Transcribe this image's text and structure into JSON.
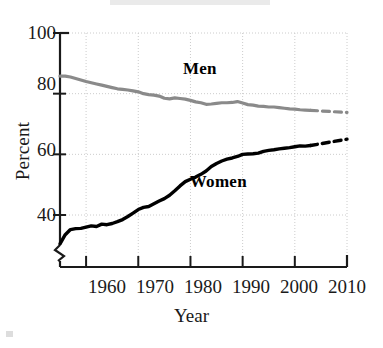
{
  "chart_data": {
    "type": "line",
    "title": "",
    "xlabel": "Year",
    "ylabel": "Percent",
    "xlim": [
      1955,
      2010
    ],
    "ylim": [
      28,
      100
    ],
    "xticks": [
      1960,
      1970,
      1980,
      1990,
      2000,
      2010
    ],
    "yticks": [
      40,
      60,
      80,
      100
    ],
    "grid": true,
    "y_axis_break": true,
    "legend_position": "inline-labels",
    "series": [
      {
        "name": "Men",
        "color": "#8a8a8a",
        "label_x": 1982,
        "label_y": 88,
        "x": [
          1955,
          1956,
          1957,
          1958,
          1959,
          1960,
          1961,
          1962,
          1963,
          1964,
          1965,
          1966,
          1967,
          1968,
          1969,
          1970,
          1971,
          1972,
          1973,
          1974,
          1975,
          1976,
          1977,
          1978,
          1979,
          1980,
          1981,
          1982,
          1983,
          1984,
          1985,
          1986,
          1987,
          1988,
          1989,
          1990,
          1991,
          1992,
          1993,
          1994,
          1995,
          1996,
          1997,
          1998,
          1999,
          2000,
          2001,
          2002,
          2003
        ],
        "y": [
          85.8,
          85.8,
          85.5,
          85.0,
          84.5,
          84.0,
          83.6,
          83.2,
          82.8,
          82.4,
          82.0,
          81.6,
          81.4,
          81.2,
          80.9,
          80.6,
          80.0,
          79.7,
          79.5,
          79.2,
          78.5,
          78.3,
          78.6,
          78.4,
          78.2,
          77.8,
          77.3,
          77.0,
          76.5,
          76.6,
          76.8,
          77.0,
          77.0,
          77.1,
          77.4,
          76.9,
          76.4,
          76.2,
          75.9,
          75.8,
          75.6,
          75.6,
          75.4,
          75.2,
          75.0,
          74.9,
          74.7,
          74.6,
          74.5
        ]
      },
      {
        "name": "Men (projected)",
        "color": "#8a8a8a",
        "style": "dashed",
        "x": [
          2003,
          2010
        ],
        "y": [
          74.5,
          73.8
        ]
      },
      {
        "name": "Women",
        "color": "#000000",
        "label_x": 1986,
        "label_y": 51,
        "x": [
          1955,
          1956,
          1957,
          1958,
          1959,
          1960,
          1961,
          1962,
          1963,
          1964,
          1965,
          1966,
          1967,
          1968,
          1969,
          1970,
          1971,
          1972,
          1973,
          1974,
          1975,
          1976,
          1977,
          1978,
          1979,
          1980,
          1981,
          1982,
          1983,
          1984,
          1985,
          1986,
          1987,
          1988,
          1989,
          1990,
          1991,
          1992,
          1993,
          1994,
          1995,
          1996,
          1997,
          1998,
          1999,
          2000,
          2001,
          2002,
          2003
        ],
        "y": [
          30.5,
          33.5,
          35.2,
          35.5,
          35.6,
          36.0,
          36.4,
          36.2,
          37.0,
          36.8,
          37.2,
          37.8,
          38.5,
          39.5,
          40.6,
          41.8,
          42.5,
          42.8,
          43.7,
          44.6,
          45.4,
          46.5,
          48.0,
          49.6,
          51.0,
          51.8,
          52.5,
          53.4,
          54.5,
          56.0,
          57.0,
          57.8,
          58.4,
          58.8,
          59.3,
          60.0,
          60.1,
          60.2,
          60.4,
          61.0,
          61.3,
          61.5,
          61.8,
          62.0,
          62.2,
          62.5,
          62.8,
          62.7,
          62.9
        ]
      },
      {
        "name": "Women (projected)",
        "color": "#000000",
        "style": "dashed",
        "x": [
          2003,
          2010
        ],
        "y": [
          62.9,
          65.0
        ]
      }
    ]
  },
  "axes": {
    "y_label": "Percent",
    "x_label": "Year",
    "y_tick_labels": [
      "100",
      "80",
      "60",
      "40"
    ],
    "x_tick_labels": [
      "1960",
      "1970",
      "1980",
      "1990",
      "2000",
      "2010"
    ]
  },
  "labels": {
    "men": "Men",
    "women": "Women"
  },
  "colors": {
    "men_line": "#8a8a8a",
    "women_line": "#000000",
    "axis": "#1a1a1a",
    "grid": "#cccccc",
    "background": "#ffffff"
  }
}
